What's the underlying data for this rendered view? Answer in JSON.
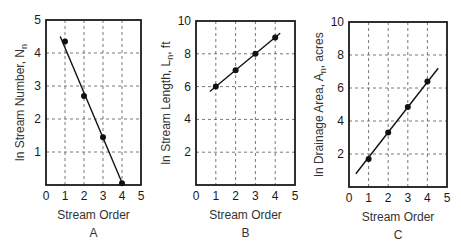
{
  "chart_data": [
    {
      "type": "scatter",
      "panel_label": "A",
      "title": "",
      "xlabel": "Stream Order",
      "ylabel": "ln Stream Number, N",
      "ylabel_subscript": "n",
      "xlim": [
        0,
        5
      ],
      "ylim": [
        0,
        5
      ],
      "x_ticks": [
        "0",
        "1",
        "2",
        "3",
        "4",
        "5"
      ],
      "y_ticks": [
        "1",
        "2",
        "3",
        "4",
        "5"
      ],
      "grid": true,
      "points": {
        "x": [
          1,
          2,
          3,
          4
        ],
        "y": [
          4.35,
          2.7,
          1.45,
          0.05
        ]
      },
      "fit_line": {
        "x": [
          0.75,
          4.05
        ],
        "y": [
          4.5,
          0.0
        ]
      }
    },
    {
      "type": "scatter",
      "panel_label": "B",
      "title": "",
      "xlabel": "Stream Order",
      "ylabel": "ln Stream Length, L",
      "ylabel_subscript": "n",
      "ylabel_suffix": ", ft",
      "xlim": [
        0,
        5
      ],
      "ylim": [
        0,
        10
      ],
      "x_ticks": [
        "0",
        "1",
        "2",
        "3",
        "4",
        "5"
      ],
      "y_ticks": [
        "2",
        "4",
        "6",
        "8",
        "10"
      ],
      "grid": true,
      "points": {
        "x": [
          1,
          2,
          3,
          4
        ],
        "y": [
          6.0,
          7.0,
          8.0,
          9.0
        ]
      },
      "fit_line": {
        "x": [
          0.7,
          4.25
        ],
        "y": [
          5.7,
          9.25
        ]
      }
    },
    {
      "type": "scatter",
      "panel_label": "C",
      "title": "",
      "xlabel": "Stream Order",
      "ylabel": "ln Drainage Area, A",
      "ylabel_subscript": "n",
      "ylabel_suffix": ", acres",
      "xlim": [
        0,
        5
      ],
      "ylim": [
        0,
        10
      ],
      "x_ticks": [
        "0",
        "1",
        "2",
        "3",
        "4",
        "5"
      ],
      "y_ticks": [
        "2",
        "4",
        "6",
        "8",
        "10"
      ],
      "grid": true,
      "points": {
        "x": [
          1,
          2,
          3,
          4
        ],
        "y": [
          1.7,
          3.3,
          4.85,
          6.4
        ]
      },
      "fit_line": {
        "x": [
          0.35,
          4.55
        ],
        "y": [
          0.8,
          7.2
        ]
      }
    }
  ],
  "layout": {
    "panels": [
      {
        "left": 46,
        "top": 20,
        "right": 141,
        "bottom": 185
      },
      {
        "left": 196,
        "top": 21,
        "right": 295,
        "bottom": 185
      },
      {
        "left": 349,
        "top": 22,
        "right": 447,
        "bottom": 187
      }
    ],
    "colors": {
      "frame": "#1a1a1a",
      "grid": "#555555",
      "line": "#111111",
      "point": "#111111"
    }
  }
}
